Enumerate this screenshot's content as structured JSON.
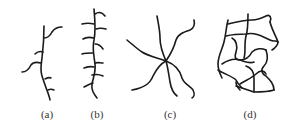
{
  "figure": {
    "panels": [
      {
        "id": "a",
        "label": "(a)",
        "structure": "branched chain"
      },
      {
        "id": "b",
        "label": "(b)",
        "structure": "comb chain"
      },
      {
        "id": "c",
        "label": "(c)",
        "structure": "star"
      },
      {
        "id": "d",
        "label": "(d)",
        "structure": "network"
      }
    ],
    "stroke_color": "#1a1a1a",
    "background_color": "#ffffff"
  }
}
